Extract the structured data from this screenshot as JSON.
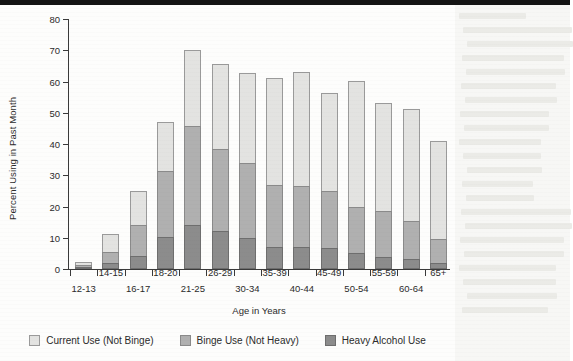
{
  "chart_data": {
    "type": "bar",
    "subtype": "stacked-bar",
    "title": "",
    "xlabel": "Age in Years",
    "ylabel": "Percent Using in Past Month",
    "ylim": [
      0,
      80
    ],
    "yticks": [
      0,
      10,
      20,
      30,
      40,
      50,
      60,
      70,
      80
    ],
    "grid": false,
    "legend_position": "bottom",
    "categories": [
      "12-13",
      "14-15",
      "16-17",
      "18-20",
      "21-25",
      "26-29",
      "30-34",
      "35-39",
      "40-44",
      "45-49",
      "50-54",
      "55-59",
      "60-64",
      "65+"
    ],
    "series": [
      {
        "name": "Heavy Alcohol Use",
        "color": "#8c8c8c",
        "values": [
          0.6,
          1.8,
          4.1,
          10.2,
          14.2,
          12.3,
          10.0,
          7.2,
          7.0,
          6.6,
          5.2,
          4.0,
          3.1,
          2.0
        ]
      },
      {
        "name": "Binge Use (Not Heavy)",
        "color": "#b0b0b0",
        "values": [
          0.7,
          3.7,
          9.9,
          21.3,
          31.5,
          26.2,
          23.8,
          19.8,
          19.5,
          18.4,
          14.8,
          14.5,
          12.4,
          7.5
        ]
      },
      {
        "name": "Current Use (Not Binge)",
        "color": "#e3e3e1",
        "values": [
          1.0,
          5.8,
          11.0,
          15.5,
          24.3,
          27.0,
          28.9,
          34.0,
          36.7,
          31.3,
          40.2,
          34.7,
          35.8,
          31.5
        ]
      }
    ],
    "totals": [
      2.3,
      11.3,
      25.0,
      47.0,
      70.0,
      65.5,
      62.7,
      61.0,
      63.2,
      56.3,
      60.2,
      53.2,
      51.3,
      41.0
    ],
    "segment_tops": {
      "heavy": [
        0.6,
        1.8,
        4.1,
        10.2,
        14.2,
        12.3,
        10.0,
        7.2,
        7.0,
        6.6,
        5.2,
        4.0,
        3.1,
        2.0
      ],
      "binge": [
        1.3,
        5.5,
        14.0,
        31.5,
        45.7,
        38.5,
        33.8,
        27.0,
        26.5,
        25.0,
        20.0,
        18.5,
        15.5,
        9.5
      ],
      "current": [
        2.3,
        11.3,
        25.0,
        47.0,
        70.0,
        65.5,
        62.7,
        61.0,
        63.2,
        56.3,
        60.2,
        53.2,
        51.3,
        41.0
      ]
    }
  },
  "legend": {
    "items": [
      {
        "label": "Current Use (Not Binge)",
        "swatch": "light-gray-swatch"
      },
      {
        "label": "Binge Use (Not Heavy)",
        "swatch": "medium-gray-swatch"
      },
      {
        "label": "Heavy Alcohol Use",
        "swatch": "dark-gray-swatch"
      }
    ]
  }
}
